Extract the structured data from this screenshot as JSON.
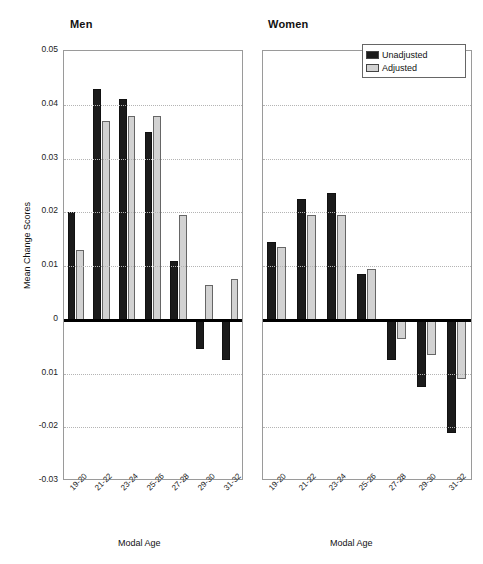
{
  "chart_data": {
    "type": "bar",
    "title": "",
    "panels": [
      {
        "name": "men",
        "label": "Men",
        "categories": [
          "19-20",
          "21-22",
          "23-24",
          "25-26",
          "27-28",
          "29-30",
          "31-32"
        ],
        "xlabel": "Modal Age",
        "ylabel": "Mean Change Scores",
        "series": [
          {
            "name": "Unadjusted",
            "color": "#1b1b1b",
            "values": [
              0.02,
              0.043,
              0.041,
              0.035,
              0.011,
              -0.0055,
              -0.0075
            ]
          },
          {
            "name": "Adjusted",
            "color": "#d2d2d2",
            "values": [
              0.013,
              0.037,
              0.038,
              0.038,
              0.0195,
              0.0065,
              0.0075
            ]
          }
        ]
      },
      {
        "name": "women",
        "label": "Women",
        "categories": [
          "19-20",
          "21-22",
          "23-24",
          "25-26",
          "27-28",
          "29-30",
          "31-32"
        ],
        "xlabel": "Modal Age",
        "ylabel": "",
        "series": [
          {
            "name": "Unadjusted",
            "color": "#1b1b1b",
            "values": [
              0.0145,
              0.0225,
              0.0235,
              0.0085,
              -0.0075,
              -0.0125,
              -0.021
            ]
          },
          {
            "name": "Adjusted",
            "color": "#d2d2d2",
            "values": [
              0.0135,
              0.0195,
              0.0195,
              0.0095,
              -0.0035,
              -0.0065,
              -0.011
            ]
          }
        ]
      }
    ],
    "ylim": [
      -0.03,
      0.05
    ],
    "ytick_values": [
      0.05,
      0.04,
      0.03,
      0.02,
      0.01,
      0,
      -0.01,
      -0.02,
      -0.03
    ],
    "ytick_labels": [
      "0.05",
      "0.04",
      "0.03",
      "0.02",
      "0.01",
      "0",
      "0.01",
      "-0.02",
      "-0.03"
    ],
    "grid": true,
    "legend": {
      "position": "top-right",
      "entries": [
        {
          "label": "Unadjusted",
          "color": "#1b1b1b"
        },
        {
          "label": "Adjusted",
          "color": "#d2d2d2"
        }
      ]
    }
  },
  "axis": {
    "y_title": "Mean Change Scores",
    "x_title": "Modal Age"
  },
  "legend": {
    "unadjusted_label": "Unadjusted",
    "adjusted_label": "Adjusted"
  },
  "panels": {
    "men_title": "Men",
    "women_title": "Women"
  }
}
